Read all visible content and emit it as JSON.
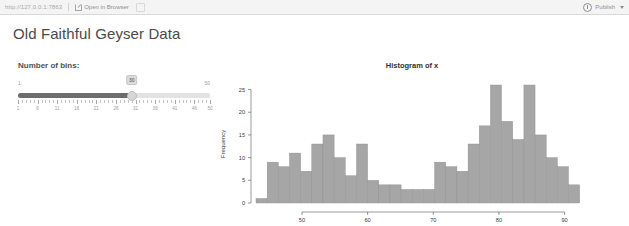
{
  "viewer": {
    "url": "http://127.0.0.1:7863",
    "open_in_browser": "Open in Browser",
    "publish": "Publish",
    "publish_icon": "publish-icon",
    "external_icon": "external-link-icon",
    "caret_icon": "chevron-down-icon",
    "refresh_icon": "refresh-icon"
  },
  "app": {
    "title": "Old Faithful Geyser Data"
  },
  "slider": {
    "label": "Number of bins:",
    "value": "30",
    "min": "1",
    "max": "50",
    "min_num": 1,
    "max_num": 50,
    "tick_labels": [
      "1",
      "6",
      "11",
      "16",
      "21",
      "26",
      "31",
      "36",
      "41",
      "46",
      "50"
    ],
    "tick_values": [
      1,
      6,
      11,
      16,
      21,
      26,
      31,
      36,
      41,
      46,
      50
    ]
  },
  "chart_data": {
    "type": "bar",
    "title": "Histogram of x",
    "xlabel": "x",
    "ylabel": "Frequency",
    "xlim": [
      43,
      96
    ],
    "ylim": [
      0,
      26
    ],
    "xticks": [
      50,
      60,
      70,
      80,
      90
    ],
    "yticks": [
      0,
      5,
      10,
      15,
      20,
      25
    ],
    "grid": false,
    "bar_color": "#a6a6a6",
    "bar_edge": "#8f8f8f",
    "bin_count": 30,
    "bin_edges": [
      43.0,
      44.7,
      46.4,
      48.1,
      49.8,
      51.5,
      53.2,
      54.9,
      56.6,
      58.3,
      60.0,
      61.7,
      63.4,
      65.1,
      66.8,
      68.5,
      70.2,
      71.9,
      73.6,
      75.3,
      77.0,
      78.7,
      80.4,
      82.1,
      83.8,
      85.5,
      87.2,
      88.9,
      90.6,
      92.3,
      94.0
    ],
    "categories": [
      "43.0-44.7",
      "44.7-46.4",
      "46.4-48.1",
      "48.1-49.8",
      "49.8-51.5",
      "51.5-53.2",
      "53.2-54.9",
      "54.9-56.6",
      "56.6-58.3",
      "58.3-60.0",
      "60.0-61.7",
      "61.7-63.4",
      "63.4-65.1",
      "65.1-66.8",
      "66.8-68.5",
      "68.5-70.2",
      "70.2-71.9",
      "71.9-73.6",
      "73.6-75.3",
      "75.3-77.0",
      "77.0-78.7",
      "78.7-80.4",
      "80.4-82.1",
      "82.1-83.8",
      "83.8-85.5",
      "85.5-87.2",
      "87.2-88.9",
      "88.9-90.6",
      "90.6-92.3",
      "92.3-94.0"
    ],
    "values": [
      1,
      9,
      8,
      11,
      7,
      13,
      15,
      10,
      6,
      13,
      5,
      4,
      4,
      3,
      3,
      3,
      9,
      8,
      7,
      13,
      17,
      26,
      18,
      14,
      26,
      15,
      10,
      8,
      4,
      0
    ]
  }
}
